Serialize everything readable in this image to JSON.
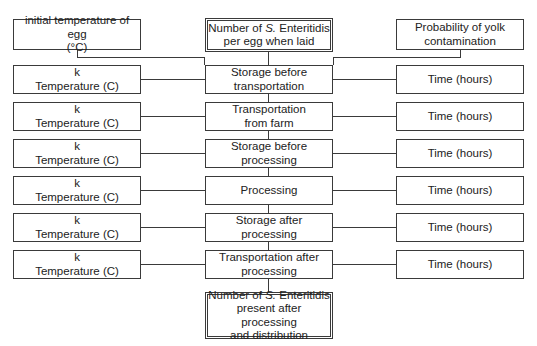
{
  "diagram": {
    "inputs": {
      "initial_temperature": [
        "initial temperature of egg",
        "(°C)"
      ],
      "number_laid": {
        "pre": "Number of ",
        "italic": "S.",
        "post": " Enteritidis",
        "line2": "per egg when laid"
      },
      "yolk_probability": [
        "Probability of yolk",
        "contamination"
      ]
    },
    "left_label_k": "k",
    "left_label_temp": "Temperature (C)",
    "right_label_time": "Time (hours)",
    "steps": [
      [
        "Storage before",
        "transportation"
      ],
      [
        "Transportation",
        "from farm"
      ],
      [
        "Storage before",
        "processing"
      ],
      [
        "Processing"
      ],
      [
        "Storage after",
        "processing"
      ],
      [
        "Transportation after",
        "processing"
      ]
    ],
    "output": {
      "pre": "Number of ",
      "italic": "S.",
      "post": " Enteritidis",
      "line2": "present after processing",
      "line3": "and distribution"
    }
  },
  "colors": {
    "line": "#3a3a3a",
    "background": "#ffffff"
  }
}
